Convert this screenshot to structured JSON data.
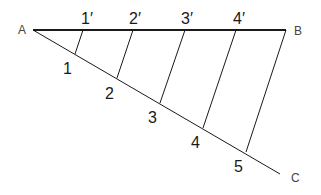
{
  "diagram": {
    "title": "",
    "points": {
      "A": {
        "label": "A",
        "x": 33,
        "y": 30
      },
      "B": {
        "label": "B",
        "x": 286,
        "y": 30
      },
      "C": {
        "label": "C",
        "x": 280,
        "y": 174
      }
    },
    "ab_divisions": [
      {
        "label": "1′",
        "x": 83,
        "y": 30
      },
      {
        "label": "2′",
        "x": 133,
        "y": 30
      },
      {
        "label": "3′",
        "x": 185,
        "y": 30
      },
      {
        "label": "4′",
        "x": 236,
        "y": 30
      }
    ],
    "ac_divisions": [
      {
        "label": "1",
        "x": 75,
        "y": 54
      },
      {
        "label": "2",
        "x": 117,
        "y": 78
      },
      {
        "label": "3",
        "x": 160,
        "y": 103
      },
      {
        "label": "4",
        "x": 203,
        "y": 128
      },
      {
        "label": "5",
        "x": 246,
        "y": 152
      }
    ],
    "colors": {
      "line": "#1a1a1a",
      "label": "#1a1a1a",
      "background": "#ffffff"
    }
  }
}
